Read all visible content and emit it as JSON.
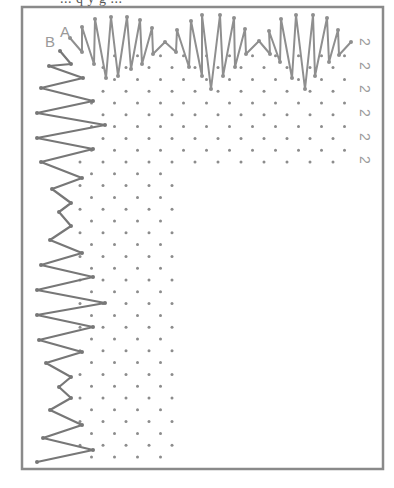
{
  "header": {
    "cut_off_caption": "... q y g ... "
  },
  "labels": {
    "a": "A",
    "b": "B"
  },
  "row_numbers": [
    "2",
    "2",
    "2",
    "2",
    "2",
    "2"
  ],
  "row_number_positions": [
    [
      364,
      42
    ],
    [
      364,
      66
    ],
    [
      364,
      89
    ],
    [
      364,
      113
    ],
    [
      364,
      137
    ],
    [
      364,
      160
    ]
  ],
  "colors": {
    "frame": "#8a8a8a",
    "stitch": "#8f8f8f",
    "stitch_dark": "#777777",
    "dot": "#8c8c8c",
    "label": "#9a9a9a"
  },
  "frame": {
    "x": 22,
    "y": 7,
    "width": 361,
    "height": 462
  },
  "label_positions": {
    "a": [
      60,
      37
    ],
    "b": [
      45,
      47
    ]
  },
  "top_stitch": [
    [
      70,
      38
    ],
    [
      82,
      52
    ],
    [
      82,
      27
    ],
    [
      94,
      64
    ],
    [
      95,
      19
    ],
    [
      106,
      78
    ],
    [
      111,
      17
    ],
    [
      118,
      76
    ],
    [
      127,
      17
    ],
    [
      131,
      69
    ],
    [
      140,
      20
    ],
    [
      142,
      64
    ],
    [
      152,
      28
    ],
    [
      153,
      54
    ],
    [
      165,
      42
    ],
    [
      176,
      52
    ],
    [
      177,
      30
    ],
    [
      189,
      67
    ],
    [
      191,
      21
    ],
    [
      202,
      76
    ],
    [
      202,
      15
    ],
    [
      211,
      89
    ],
    [
      220,
      15
    ],
    [
      223,
      76
    ],
    [
      234,
      18
    ],
    [
      235,
      67
    ],
    [
      245,
      29
    ],
    [
      246,
      54
    ],
    [
      259,
      41
    ],
    [
      270,
      54
    ],
    [
      269,
      31
    ],
    [
      280,
      62
    ],
    [
      281,
      19
    ],
    [
      292,
      78
    ],
    [
      296,
      15
    ],
    [
      305,
      89
    ],
    [
      313,
      15
    ],
    [
      315,
      76
    ],
    [
      327,
      18
    ],
    [
      329,
      62
    ],
    [
      338,
      30
    ],
    [
      339,
      55
    ],
    [
      351,
      42
    ]
  ],
  "left_stitch": [
    [
      60,
      51
    ],
    [
      71,
      64
    ],
    [
      49,
      66
    ],
    [
      83,
      78
    ],
    [
      41,
      88
    ],
    [
      93,
      101
    ],
    [
      37,
      113
    ],
    [
      105,
      125
    ],
    [
      37,
      138
    ],
    [
      93,
      149
    ],
    [
      41,
      162
    ],
    [
      82,
      178
    ],
    [
      52,
      189
    ],
    [
      71,
      203
    ],
    [
      59,
      212
    ],
    [
      71,
      226
    ],
    [
      50,
      240
    ],
    [
      82,
      253
    ],
    [
      41,
      265
    ],
    [
      93,
      277
    ],
    [
      37,
      290
    ],
    [
      105,
      303
    ],
    [
      37,
      315
    ],
    [
      93,
      327
    ],
    [
      39,
      340
    ],
    [
      82,
      352
    ],
    [
      46,
      363
    ],
    [
      71,
      377
    ],
    [
      59,
      387
    ],
    [
      71,
      398
    ],
    [
      50,
      410
    ],
    [
      82,
      425
    ],
    [
      43,
      438
    ],
    [
      93,
      450
    ],
    [
      37,
      462
    ]
  ],
  "left_stitch_bottom": [
    [
      43,
      398
    ],
    [
      93,
      393
    ],
    [
      37,
      402
    ],
    [
      105,
      392
    ],
    [
      37,
      410
    ],
    [
      93,
      415
    ],
    [
      41,
      425
    ],
    [
      82,
      430
    ],
    [
      52,
      436
    ],
    [
      71,
      442
    ],
    [
      59,
      450
    ],
    [
      71,
      460
    ],
    [
      50,
      463
    ],
    [
      70,
      470
    ]
  ],
  "dot_grid": {
    "row_start_y": 44,
    "row_step": 11.8,
    "rows": 36,
    "col_step": 23,
    "horizontal_band": {
      "y_max": 165,
      "x_max": 352
    },
    "vertical_band": {
      "x_min": 80,
      "x_max": 180
    }
  }
}
